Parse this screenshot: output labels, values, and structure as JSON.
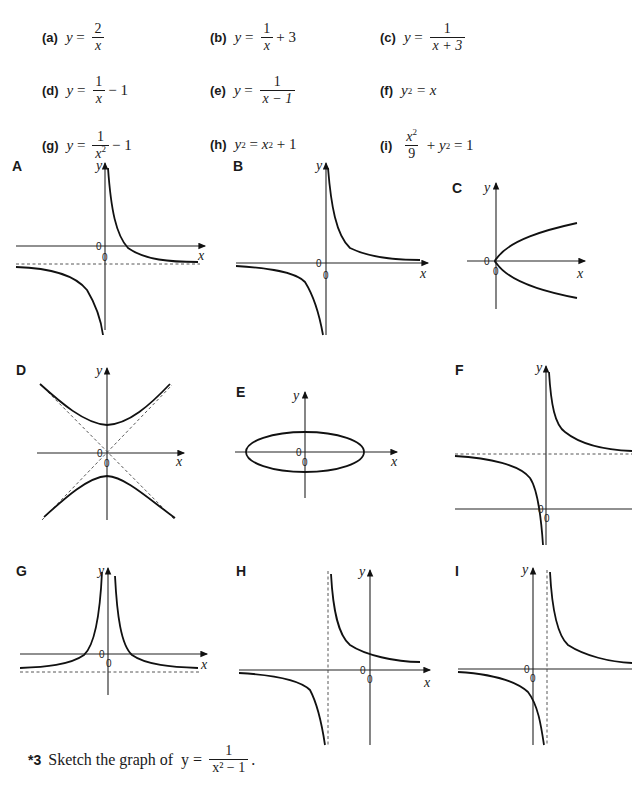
{
  "equations": [
    {
      "label": "(a)",
      "lhs": "y",
      "text": "y = 2/x",
      "num": "2",
      "den": "x",
      "after": ""
    },
    {
      "label": "(b)",
      "lhs": "y",
      "text": "y = 1/x + 3",
      "num": "1",
      "den": "x",
      "after": "+ 3"
    },
    {
      "label": "(c)",
      "lhs": "y",
      "text": "y = 1/(x + 3)",
      "num": "1",
      "den": "x + 3",
      "after": ""
    },
    {
      "label": "(d)",
      "lhs": "y",
      "text": "y = 1/x − 1",
      "num": "1",
      "den": "x",
      "after": "− 1"
    },
    {
      "label": "(e)",
      "lhs": "y",
      "text": "y = 1/(x − 1)",
      "num": "1",
      "den": "x − 1",
      "after": ""
    },
    {
      "label": "(f)",
      "text": "y² = x",
      "plain": "= x"
    },
    {
      "label": "(g)",
      "lhs": "y",
      "text": "y = 1/x² − 1",
      "num": "1",
      "den": "x",
      "after": "− 1"
    },
    {
      "label": "(h)",
      "text": "y² = x² + 1",
      "plain": "+ 1"
    },
    {
      "label": "(i)",
      "text": "x²/9 + y² = 1",
      "num": "x",
      "den": "9",
      "after": "= 1"
    }
  ],
  "graphs": [
    {
      "label": "A",
      "description": "rectangular hyperbola shifted down, horizontal asymptote below x-axis"
    },
    {
      "label": "B",
      "description": "rectangular hyperbola in first and third quadrants"
    },
    {
      "label": "C",
      "description": "sideways parabola opening right through origin"
    },
    {
      "label": "D",
      "description": "hyperbola opening up/down with dashed oblique asymptotes"
    },
    {
      "label": "E",
      "description": "horizontal ellipse centred at origin"
    },
    {
      "label": "F",
      "description": "hyperbola shifted up, horizontal asymptote above x-axis"
    },
    {
      "label": "G",
      "description": "symmetric curve about y-axis with horizontal asymptote below x-axis"
    },
    {
      "label": "H",
      "description": "hyperbola with vertical asymptote left of y-axis"
    },
    {
      "label": "I",
      "description": "hyperbola with vertical asymptote right of y-axis"
    }
  ],
  "axis_labels": {
    "x": "x",
    "y": "y",
    "origin": "0"
  },
  "question": {
    "number": "*3",
    "text": "Sketch the graph of",
    "lhs": "y =",
    "num": "1",
    "den": "x² − 1",
    "end": "."
  }
}
